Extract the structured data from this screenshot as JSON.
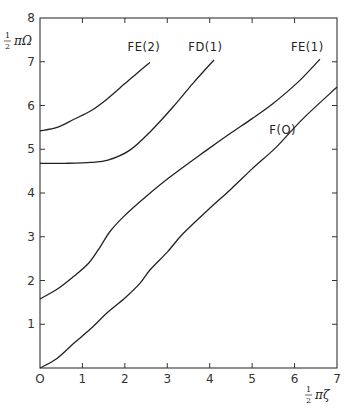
{
  "chart_data": {
    "type": "line",
    "title": "",
    "xlabel": "½ πζ",
    "ylabel": "½ πΩ",
    "xlim": [
      0,
      7
    ],
    "ylim": [
      0,
      8
    ],
    "xticks": [
      "0",
      "1",
      "2",
      "3",
      "4",
      "5",
      "6",
      "7"
    ],
    "yticks": [
      "1",
      "2",
      "3",
      "4",
      "5",
      "6",
      "7",
      "8"
    ],
    "grid": false,
    "legend": "inline labels at curve ends",
    "series": [
      {
        "name": "FE(2)",
        "label_pos": [
          2.45,
          7.25
        ],
        "points": [
          [
            0,
            5.42
          ],
          [
            0.4,
            5.5
          ],
          [
            0.79,
            5.68
          ],
          [
            1.2,
            5.88
          ],
          [
            1.57,
            6.14
          ],
          [
            2.0,
            6.5
          ],
          [
            2.3,
            6.75
          ],
          [
            2.59,
            6.98
          ]
        ]
      },
      {
        "name": "FD(1)",
        "label_pos": [
          3.9,
          7.25
        ],
        "points": [
          [
            0,
            4.68
          ],
          [
            0.6,
            4.68
          ],
          [
            1.2,
            4.7
          ],
          [
            1.6,
            4.75
          ],
          [
            2.12,
            4.98
          ],
          [
            2.6,
            5.4
          ],
          [
            3.14,
            5.97
          ],
          [
            3.6,
            6.5
          ],
          [
            4.1,
            7.04
          ]
        ]
      },
      {
        "name": "FE(1)",
        "label_pos": [
          6.3,
          7.25
        ],
        "points": [
          [
            0,
            1.58
          ],
          [
            0.4,
            1.8
          ],
          [
            0.79,
            2.09
          ],
          [
            1.15,
            2.4
          ],
          [
            1.42,
            2.77
          ],
          [
            1.65,
            3.12
          ],
          [
            1.97,
            3.46
          ],
          [
            2.5,
            3.92
          ],
          [
            3.07,
            4.37
          ],
          [
            3.93,
            4.98
          ],
          [
            4.48,
            5.36
          ],
          [
            5.0,
            5.7
          ],
          [
            5.5,
            6.05
          ],
          [
            6.1,
            6.55
          ],
          [
            6.6,
            7.06
          ]
        ]
      },
      {
        "name": "F(0)",
        "label_pos": [
          5.72,
          5.35
        ],
        "points": [
          [
            0,
            0
          ],
          [
            0.4,
            0.22
          ],
          [
            0.79,
            0.56
          ],
          [
            1.2,
            0.9
          ],
          [
            1.57,
            1.25
          ],
          [
            2.0,
            1.6
          ],
          [
            2.36,
            1.94
          ],
          [
            2.59,
            2.24
          ],
          [
            3.0,
            2.65
          ],
          [
            3.38,
            3.08
          ],
          [
            4.0,
            3.65
          ],
          [
            4.48,
            4.07
          ],
          [
            5.0,
            4.55
          ],
          [
            5.58,
            5.06
          ],
          [
            6.2,
            5.7
          ],
          [
            7.0,
            6.42
          ]
        ]
      }
    ]
  },
  "axes": {
    "x_title_frac": "1",
    "x_title_den": "2",
    "x_title_sym": "πζ",
    "y_title_frac": "1",
    "y_title_den": "2",
    "y_title_sym": "πΩ"
  }
}
